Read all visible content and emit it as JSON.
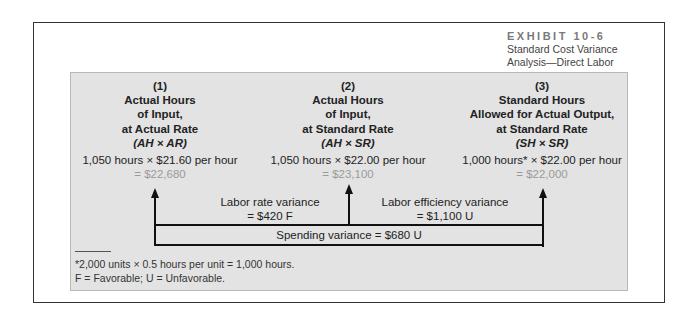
{
  "exhibit": {
    "number": "EXHIBIT 10-6",
    "caption_line1": "Standard Cost Variance",
    "caption_line2": "Analysis—Direct Labor"
  },
  "columns": [
    {
      "index": "(1)",
      "title_lines": [
        "Actual Hours",
        "of Input,",
        "at Actual Rate"
      ],
      "formula": "(AH × AR)",
      "calculation": "1,050 hours × $21.60 per hour",
      "result": "= $22,680"
    },
    {
      "index": "(2)",
      "title_lines": [
        "Actual Hours",
        "of Input,",
        "at Standard Rate"
      ],
      "formula": "(AH × SR)",
      "calculation": "1,050 hours × $22.00 per hour",
      "result": "= $23,100"
    },
    {
      "index": "(3)",
      "title_lines": [
        "Standard Hours",
        "Allowed for Actual Output,",
        "at Standard Rate"
      ],
      "formula": "(SH × SR)",
      "calculation": "1,000 hours* × $22.00 per hour",
      "result": "= $22,000"
    }
  ],
  "variances": {
    "rate_label": "Labor rate variance",
    "rate_value": "= $420 F",
    "efficiency_label": "Labor efficiency variance",
    "efficiency_value": "= $1,100 U",
    "spending": "Spending variance = $680 U"
  },
  "footnotes": {
    "line1": "*2,000 units × 0.5 hours per unit = 1,000 hours.",
    "line2": "F = Favorable; U = Unfavorable."
  }
}
